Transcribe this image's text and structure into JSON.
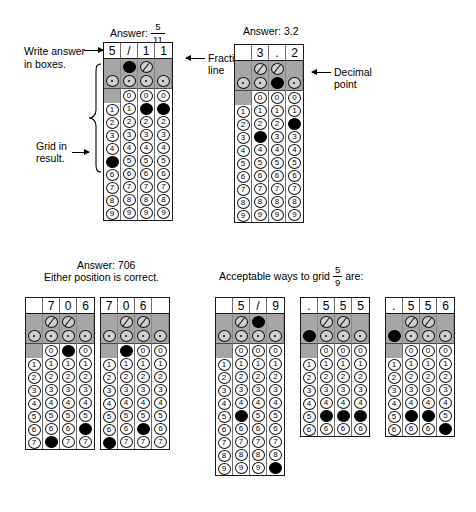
{
  "page": {
    "width": 476,
    "height": 512,
    "ink_color": "#000000",
    "band_color": "#a6a6a6"
  },
  "annotations": {
    "write_answer": "Write answer",
    "in_boxes": "in boxes.",
    "grid_in": "Grid in",
    "result": "result.",
    "fraction_line": "Fraction",
    "fraction_line2": "line",
    "decimal_point": "Decimal",
    "decimal_point2": "point"
  },
  "captions": {
    "answer_label": "Answer:",
    "grid1_fraction_num": "5",
    "grid1_fraction_den": "11",
    "grid2_value": "3.2",
    "grid34_line1": "Answer: 706",
    "grid34_line2": "Either position is correct.",
    "grid567_prefix": "Acceptable ways to grid",
    "grid567_num": "5",
    "grid567_den": "9",
    "grid567_suffix": "are:"
  },
  "symbols": {
    "slash": "/",
    "decimal": ".",
    "digits": [
      "0",
      "1",
      "2",
      "3",
      "4",
      "5",
      "6",
      "7",
      "8",
      "9"
    ]
  },
  "grids": [
    {
      "name": "grid-five-elevenths",
      "columns": 4,
      "header": [
        "5",
        "/",
        "1",
        "1"
      ],
      "slash_row": [
        "blank",
        "filled",
        "open",
        "blank"
      ],
      "decimal_row": [
        "open",
        "open",
        "open",
        "open"
      ],
      "zero_row": [
        "blank",
        "open",
        "open",
        "open"
      ],
      "digits_start": 1,
      "digits_end": 9,
      "filled": [
        {
          "column": 1,
          "digit": 5
        },
        {
          "column": 3,
          "digit": 1
        },
        {
          "column": 4,
          "digit": 1
        }
      ]
    },
    {
      "name": "grid-three-point-two",
      "columns": 4,
      "header": [
        "",
        "3",
        ".",
        "2"
      ],
      "slash_row": [
        "blank",
        "open",
        "open",
        "blank"
      ],
      "decimal_row": [
        "open",
        "open",
        "filled",
        "open"
      ],
      "zero_row": [
        "blank",
        "open",
        "open",
        "open"
      ],
      "digits_start": 1,
      "digits_end": 9,
      "filled": [
        {
          "column": 2,
          "digit": 3
        },
        {
          "column": 4,
          "digit": 2
        }
      ]
    },
    {
      "name": "grid-706-right",
      "columns": 4,
      "header": [
        "",
        "7",
        "0",
        "6"
      ],
      "slash_row": [
        "blank",
        "open",
        "open",
        "blank"
      ],
      "decimal_row": [
        "open",
        "open",
        "open",
        "open"
      ],
      "zero_row": [
        "blank",
        "open",
        "filled",
        "open"
      ],
      "digits_start": 1,
      "digits_end": 7,
      "truncated": true,
      "filled": [
        {
          "column": 2,
          "digit": 7
        },
        {
          "column": 4,
          "digit": 6
        }
      ]
    },
    {
      "name": "grid-706-left",
      "columns": 4,
      "header": [
        "7",
        "0",
        "6",
        ""
      ],
      "slash_row": [
        "blank",
        "open",
        "open",
        "blank"
      ],
      "decimal_row": [
        "open",
        "open",
        "open",
        "open"
      ],
      "zero_row": [
        "blank",
        "filled",
        "open",
        "open"
      ],
      "digits_start": 1,
      "digits_end": 7,
      "truncated": true,
      "filled": [
        {
          "column": 1,
          "digit": 7
        },
        {
          "column": 3,
          "digit": 6
        }
      ]
    },
    {
      "name": "grid-five-ninths-fraction",
      "columns": 4,
      "header": [
        "",
        "5",
        "/",
        "9"
      ],
      "slash_row": [
        "blank",
        "open",
        "filled",
        "blank"
      ],
      "decimal_row": [
        "open",
        "open",
        "open",
        "open"
      ],
      "zero_row": [
        "blank",
        "open",
        "open",
        "open"
      ],
      "digits_start": 1,
      "digits_end": 9,
      "truncated": true,
      "filled": [
        {
          "column": 2,
          "digit": 5
        },
        {
          "column": 4,
          "digit": 9
        }
      ]
    },
    {
      "name": "grid-point-555",
      "columns": 4,
      "header": [
        ".",
        "5",
        "5",
        "5"
      ],
      "slash_row": [
        "blank",
        "open",
        "open",
        "blank"
      ],
      "decimal_row": [
        "filled",
        "open",
        "open",
        "open"
      ],
      "zero_row": [
        "blank",
        "open",
        "open",
        "open"
      ],
      "digits_start": 1,
      "digits_end": 6,
      "truncated": true,
      "filled": [
        {
          "column": 2,
          "digit": 5
        },
        {
          "column": 3,
          "digit": 5
        },
        {
          "column": 4,
          "digit": 5
        }
      ]
    },
    {
      "name": "grid-point-556",
      "columns": 4,
      "header": [
        ".",
        "5",
        "5",
        "6"
      ],
      "slash_row": [
        "blank",
        "open",
        "open",
        "blank"
      ],
      "decimal_row": [
        "filled",
        "open",
        "open",
        "open"
      ],
      "zero_row": [
        "blank",
        "open",
        "open",
        "open"
      ],
      "digits_start": 1,
      "digits_end": 6,
      "truncated": true,
      "filled": [
        {
          "column": 2,
          "digit": 5
        },
        {
          "column": 3,
          "digit": 5
        },
        {
          "column": 4,
          "digit": 6
        }
      ]
    }
  ]
}
